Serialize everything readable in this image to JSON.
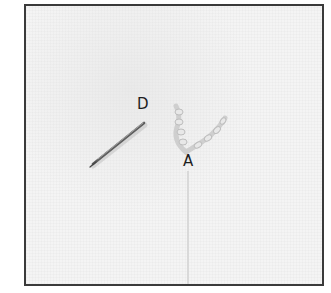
{
  "figure": {
    "labels": {
      "d": "D",
      "a": "A"
    },
    "colors": {
      "fabric": "#f4f4f4",
      "frame_border": "#3a3a3a",
      "needle": "#6b6b6b",
      "thread": "#d6d6d6",
      "label_text": "#1e1e1e"
    }
  }
}
